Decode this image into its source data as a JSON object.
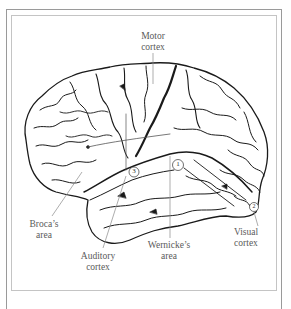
{
  "figure": {
    "labels": [
      {
        "id": "motor",
        "line1": "Motor",
        "line2": "cortex"
      },
      {
        "id": "broca",
        "line1": "Broca’s",
        "line2": "area"
      },
      {
        "id": "auditory",
        "line1": "Auditory",
        "line2": "cortex"
      },
      {
        "id": "wernicke",
        "line1": "Wernicke’s",
        "line2": "area"
      },
      {
        "id": "visual",
        "line1": "Visual",
        "line2": "cortex"
      }
    ],
    "markers": [
      {
        "id": "marker-1",
        "text": "1"
      },
      {
        "id": "marker-3",
        "text": "3"
      },
      {
        "id": "marker-2",
        "text": "2"
      }
    ],
    "colors": {
      "ink": "#1a1a1a",
      "label_text": "#5a5a5a",
      "leader_line": "#8a8a8a",
      "frame": "#9a9a9a",
      "background": "#ffffff"
    }
  }
}
